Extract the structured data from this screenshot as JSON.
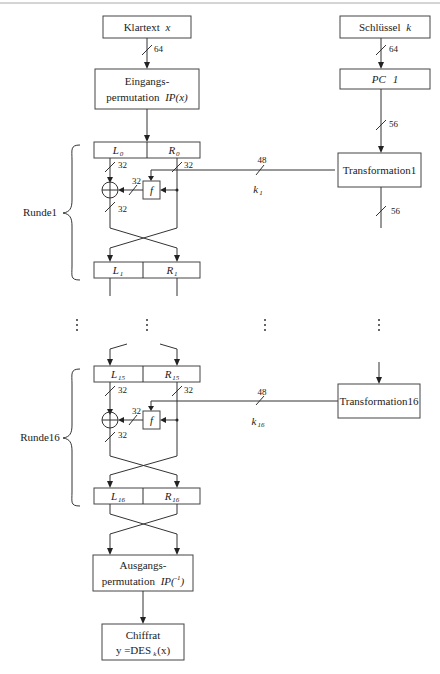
{
  "diagram": {
    "title_hint": "DES encryption structure",
    "colors": {
      "line": "#333333",
      "background": "#ffffff",
      "top_rule": "#999999"
    },
    "input": {
      "label": "Klartext",
      "var": "x",
      "bits": "64"
    },
    "initial_perm": {
      "line1": "Eingangs-",
      "line2": "permutation",
      "var": "IP(x)"
    },
    "key": {
      "label": "Schlüssel",
      "var": "k",
      "bits": "64"
    },
    "pc1": {
      "label": "PC",
      "num": "1",
      "bits": "56"
    },
    "round1": {
      "label": "Runde1",
      "L_in": "L",
      "L_in_sub": "0",
      "R_in": "R",
      "R_in_sub": "0",
      "L_out": "L",
      "L_out_sub": "1",
      "R_out": "R",
      "R_out_sub": "1",
      "bits_left": "32",
      "bits_right": "32",
      "bits_f": "32",
      "bits_xor_out": "32",
      "f_label": "f",
      "key_bits": "48",
      "key_label": "k",
      "key_sub": "1",
      "transform": "Transformation1",
      "transform_out_bits": "56"
    },
    "round16": {
      "label": "Runde16",
      "L_in": "L",
      "L_in_sub": "15",
      "R_in": "R",
      "R_in_sub": "15",
      "L_out": "L",
      "L_out_sub": "16",
      "R_out": "R",
      "R_out_sub": "16",
      "bits_left": "32",
      "bits_right": "32",
      "bits_f": "32",
      "bits_xor_out": "32",
      "f_label": "f",
      "key_bits": "48",
      "key_label": "k",
      "key_sub": "16",
      "transform": "Transformation16"
    },
    "final_perm": {
      "line1": "Ausgangs-",
      "line2": "permutation",
      "var": "IP(",
      "var_tail": ")"
    },
    "output": {
      "line1": "Chiffrat",
      "line2_pre": "y =DES",
      "line2_sub": "k",
      "line2_post": "(x)"
    },
    "ellipsis": "⋮"
  }
}
